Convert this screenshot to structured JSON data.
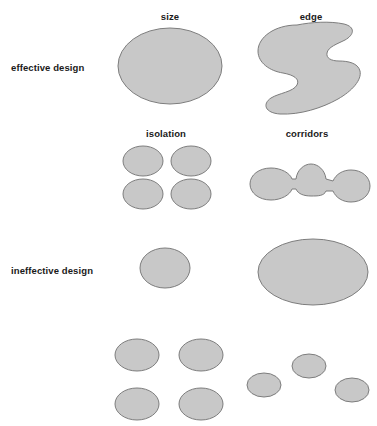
{
  "figure": {
    "title_present": false,
    "background_color": "#ffffff",
    "patch_fill_color": "#c8c8c8",
    "patch_stroke_color": "#7d7d7d"
  },
  "column_labels": [
    {
      "text": "size",
      "x": 170,
      "y": 11
    },
    {
      "text": "edge",
      "x": 311,
      "y": 11
    },
    {
      "text": "isolation",
      "x": 166,
      "y": 128
    },
    {
      "text": "corridors",
      "x": 307,
      "y": 128
    }
  ],
  "row_labels": [
    {
      "text": "effective design",
      "x": 11,
      "y": 62
    },
    {
      "text": "ineffective design",
      "x": 11,
      "y": 265
    }
  ],
  "panels": [
    {
      "name": "size-effective",
      "row": "effective design",
      "column": "size",
      "description": "one large single ellipse patch",
      "patch_count": 1
    },
    {
      "name": "edge-effective",
      "row": "effective design",
      "column": "edge",
      "description": "one compact blob with convoluted edge notch",
      "patch_count": 1
    },
    {
      "name": "isolation-effective",
      "row": "effective design",
      "column": "isolation",
      "description": "four ellipse patches clustered close together",
      "patch_count": 4
    },
    {
      "name": "corridors-effective",
      "row": "effective design",
      "column": "corridors",
      "description": "three round patches linked by narrow corridors",
      "patch_count": 3
    },
    {
      "name": "size-ineffective",
      "row": "ineffective design",
      "column": "size",
      "description": "one small ellipse patch",
      "patch_count": 1
    },
    {
      "name": "edge-ineffective",
      "row": "ineffective design",
      "column": "edge",
      "description": "one large smooth ellipse with simple edge",
      "patch_count": 1
    },
    {
      "name": "isolation-ineffective",
      "row": "ineffective design",
      "column": "isolation",
      "description": "four ellipse patches spread far apart",
      "patch_count": 4
    },
    {
      "name": "corridors-ineffective",
      "row": "ineffective design",
      "column": "corridors",
      "description": "three small patches scattered with no connections",
      "patch_count": 3
    }
  ],
  "shapes": {
    "size_effective_ellipse": {
      "cx": 170,
      "cy": 66,
      "rx": 52,
      "ry": 38
    },
    "size_ineffective_ellipse": {
      "cx": 165,
      "cy": 268,
      "rx": 25,
      "ry": 20
    },
    "edge_ineffective_ellipse": {
      "cx": 313,
      "cy": 272,
      "rx": 55,
      "ry": 33
    },
    "isolation_effective_ellipses": [
      {
        "cx": 143,
        "cy": 161,
        "rx": 20,
        "ry": 15
      },
      {
        "cx": 191,
        "cy": 161,
        "rx": 20,
        "ry": 15
      },
      {
        "cx": 143,
        "cy": 194,
        "rx": 20,
        "ry": 15
      },
      {
        "cx": 191,
        "cy": 194,
        "rx": 20,
        "ry": 15
      }
    ],
    "isolation_ineffective_ellipses": [
      {
        "cx": 137,
        "cy": 355,
        "rx": 22,
        "ry": 16
      },
      {
        "cx": 201,
        "cy": 355,
        "rx": 22,
        "ry": 16
      },
      {
        "cx": 137,
        "cy": 404,
        "rx": 22,
        "ry": 16
      },
      {
        "cx": 201,
        "cy": 404,
        "rx": 22,
        "ry": 16
      }
    ],
    "corridors_effective_nodes": [
      {
        "cx": 271,
        "cy": 184,
        "rx": 21,
        "ry": 16
      },
      {
        "cx": 311,
        "cy": 180,
        "rx": 17,
        "ry": 16
      },
      {
        "cx": 351,
        "cy": 186,
        "rx": 19,
        "ry": 16
      }
    ],
    "corridors_ineffective_ellipses": [
      {
        "cx": 264,
        "cy": 385,
        "rx": 17,
        "ry": 12
      },
      {
        "cx": 309,
        "cy": 366,
        "rx": 17,
        "ry": 12
      },
      {
        "cx": 352,
        "cy": 390,
        "rx": 17,
        "ry": 12
      }
    ]
  }
}
